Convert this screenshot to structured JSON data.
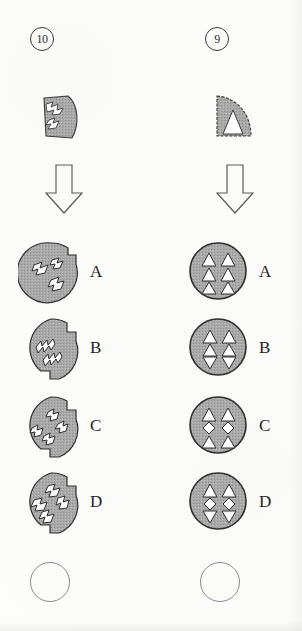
{
  "document": {
    "kind": "paper-folding-punch logic test worksheet",
    "columns": 2,
    "option_letters": [
      "A",
      "B",
      "C",
      "D"
    ]
  },
  "colors": {
    "shape_fill": "#a9a9a9",
    "shape_stroke": "#2f2f2f",
    "cut_fill": "#ffffff",
    "text": "#1f1f1f",
    "paper": "#fdfdfc",
    "bubble_stroke": "#8a8a92"
  },
  "questions": [
    {
      "number": "10",
      "prompt_shape": "folded quarter wedge with zigzag arrow cut-outs",
      "arrow": "down-arrow",
      "options": [
        {
          "letter": "A",
          "pattern": "circle with two notches, three arrow-shaped cut-outs scattered"
        },
        {
          "letter": "B",
          "pattern": "circle with notches, two diagonal rows of zigzag cut-outs"
        },
        {
          "letter": "C",
          "pattern": "circle with four notches, zigzag cut-outs crossing diagonally"
        },
        {
          "letter": "D",
          "pattern": "circle with four notches, four arrow cut-outs radiating from center"
        }
      ],
      "answer_value": ""
    },
    {
      "number": "9",
      "prompt_shape": "folded quarter wedge with triangular cut-out",
      "arrow": "down-arrow",
      "options": [
        {
          "letter": "A",
          "pattern": "circle with six upward triangles in 3 rows x 2 columns"
        },
        {
          "letter": "B",
          "pattern": "circle, two columns: up triangle, up triangle, down triangle"
        },
        {
          "letter": "C",
          "pattern": "circle, rows: up triangles, diamonds, up triangles"
        },
        {
          "letter": "D",
          "pattern": "circle, two columns: up triangle, diamond, down triangle"
        }
      ],
      "answer_value": ""
    }
  ]
}
